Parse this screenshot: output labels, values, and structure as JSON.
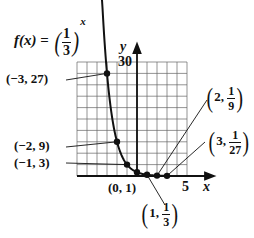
{
  "chart_data": {
    "type": "line",
    "title_parts": {
      "lhs": "f(x)",
      "eq": "=",
      "base_num": "1",
      "base_den": "3",
      "exponent": "x"
    },
    "xlabel": "x",
    "ylabel": "y",
    "x_tick_labels": [
      "5"
    ],
    "y_tick_labels": [
      "30"
    ],
    "xlim": [
      -6,
      5
    ],
    "ylim": [
      0,
      30
    ],
    "grid": true,
    "grid_x_step": 1,
    "grid_y_step": 3,
    "series": [
      {
        "name": "f(x) = (1/3)^x",
        "x": [
          -3,
          -2,
          -1,
          0,
          1,
          2,
          3
        ],
        "y": [
          27,
          9,
          3,
          1,
          0.3333,
          0.1111,
          0.037
        ]
      }
    ],
    "annotations": [
      {
        "label": "(−3, 27)",
        "point": [
          -3,
          27
        ]
      },
      {
        "label": "(−2, 9)",
        "point": [
          -2,
          9
        ]
      },
      {
        "label": "(−1, 3)",
        "point": [
          -1,
          3
        ]
      },
      {
        "label": "(0, 1)",
        "point": [
          0,
          1
        ]
      },
      {
        "label": "(1, 1/3)",
        "point": [
          1,
          0.3333
        ],
        "x_text": "1",
        "num": "1",
        "den": "3"
      },
      {
        "label": "(2, 1/9)",
        "point": [
          2,
          0.1111
        ],
        "x_text": "2",
        "num": "1",
        "den": "9"
      },
      {
        "label": "(3, 1/27)",
        "point": [
          3,
          0.037
        ],
        "x_text": "3",
        "num": "1",
        "den": "27"
      }
    ]
  },
  "colors": {
    "ink": "#111111",
    "grid": "#555555",
    "background": "#ffffff"
  }
}
